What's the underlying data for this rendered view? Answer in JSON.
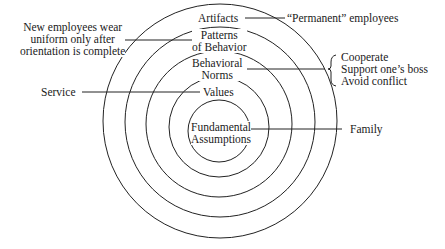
{
  "diagram": {
    "type": "concentric-layers",
    "title": "",
    "layers": [
      {
        "name": "Artifacts",
        "line1": "Artifacts",
        "line2": ""
      },
      {
        "name": "Patterns of Behavior",
        "line1": "Patterns",
        "line2": "of Behavior"
      },
      {
        "name": "Behavioral Norms",
        "line1": "Behavioral",
        "line2": "Norms"
      },
      {
        "name": "Values",
        "line1": "Values",
        "line2": ""
      },
      {
        "name": "Fundamental Assumptions",
        "line1": "Fundamental",
        "line2": "Assumptions"
      }
    ],
    "examples": {
      "artifacts": "“Permanent” employees",
      "patterns": [
        "New employees wear",
        "uniform only after",
        "orientation is complete"
      ],
      "norms": [
        "Cooperate",
        "Support one’s boss",
        "Avoid conflict"
      ],
      "values": "Service",
      "assumptions": "Family"
    },
    "stroke_color": "#222222"
  }
}
